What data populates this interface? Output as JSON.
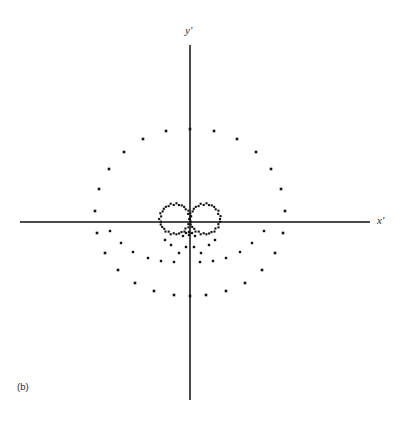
{
  "figure": {
    "caption": "(b)",
    "x_axis_label": "x'",
    "y_axis_label": "y'",
    "dot_color": "#111111",
    "axis_color": "#4a4a4a",
    "background_color": "#ffffff"
  },
  "chart_data": {
    "type": "scatter",
    "title": "",
    "subtitle": "",
    "xlabel": "x'",
    "ylabel": "y'",
    "annotations": [
      "(b)"
    ],
    "grid": false,
    "legend": null,
    "axes": {
      "origin_px": [
        190,
        222
      ],
      "x_axis_span_px": [
        20,
        370
      ],
      "y_axis_span_px": [
        45,
        400
      ],
      "xlim": [
        -1.85,
        1.9
      ],
      "ylim": [
        -1.9,
        1.9
      ],
      "ticks": [],
      "tick_labels": []
    },
    "series": [
      {
        "name": "outer-orbit",
        "description": "large dotted circular orbit, evenly spaced in upper half, compressed and flattened in lower half",
        "marker": "square-dot",
        "marker_size_px": 2.6,
        "radius_px": 93,
        "points_px": [
          [
            190,
            129
          ],
          [
            214,
            131
          ],
          [
            237,
            139
          ],
          [
            256,
            152
          ],
          [
            271,
            169
          ],
          [
            281,
            189
          ],
          [
            285,
            211
          ],
          [
            283,
            233
          ],
          [
            275,
            253
          ],
          [
            262,
            270
          ],
          [
            245,
            283
          ],
          [
            226,
            291
          ],
          [
            206,
            295
          ],
          [
            190,
            296
          ],
          [
            174,
            295
          ],
          [
            154,
            291
          ],
          [
            135,
            283
          ],
          [
            118,
            270
          ],
          [
            105,
            253
          ],
          [
            97,
            233
          ],
          [
            95,
            211
          ],
          [
            99,
            189
          ],
          [
            109,
            169
          ],
          [
            124,
            152
          ],
          [
            143,
            139
          ],
          [
            166,
            131
          ]
        ]
      },
      {
        "name": "inner-left-lobe",
        "description": "dense dotted small loop left of origin, part of figure-eight",
        "marker": "square-dot",
        "marker_size_px": 2.1,
        "center_px": [
          175,
          219
        ],
        "radius_px": 15,
        "n_points": 34
      },
      {
        "name": "inner-right-lobe",
        "description": "dense dotted small loop right of origin, part of figure-eight",
        "marker": "square-dot",
        "marker_size_px": 2.1,
        "center_px": [
          205,
          219
        ],
        "radius_px": 15,
        "n_points": 34
      },
      {
        "name": "origin-cluster",
        "description": "dense dot cluster just below the origin where lobes cross",
        "marker": "square-dot",
        "marker_size_px": 2.3,
        "points_px": [
          [
            189,
            232
          ],
          [
            186,
            233
          ],
          [
            192,
            233
          ],
          [
            189,
            235
          ],
          [
            183,
            236
          ],
          [
            195,
            236
          ]
        ]
      },
      {
        "name": "lower-scatter",
        "description": "scattered dots below the x-axis between the inner lobes and the outer orbit",
        "marker": "square-dot",
        "marker_size_px": 2.4,
        "points_px": [
          [
            110,
            231
          ],
          [
            121,
            243
          ],
          [
            133,
            252
          ],
          [
            148,
            258
          ],
          [
            161,
            261
          ],
          [
            174,
            262
          ],
          [
            179,
            253
          ],
          [
            171,
            245
          ],
          [
            165,
            240
          ],
          [
            200,
            262
          ],
          [
            213,
            261
          ],
          [
            226,
            258
          ],
          [
            240,
            252
          ],
          [
            252,
            243
          ],
          [
            264,
            231
          ],
          [
            201,
            253
          ],
          [
            209,
            245
          ],
          [
            215,
            240
          ],
          [
            186,
            247
          ],
          [
            194,
            247
          ]
        ]
      }
    ]
  }
}
